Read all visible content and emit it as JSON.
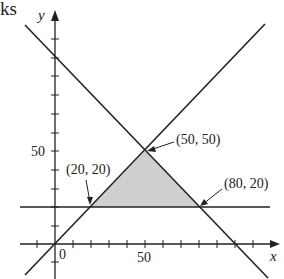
{
  "header_fragment": "ks",
  "diagram": {
    "type": "linear-programming-feasible-region",
    "axes": {
      "x_label": "x",
      "y_label": "y",
      "origin_label": "0",
      "x_tick_label": "50",
      "y_tick_label": "50",
      "tick_interval": 10
    },
    "lines": [
      {
        "name": "y = x",
        "description": "diagonal through origin"
      },
      {
        "name": "x + y = 100",
        "description": "descending diagonal"
      },
      {
        "name": "y = 20",
        "description": "horizontal line"
      }
    ],
    "feasible_region": {
      "shape": "triangle",
      "fill_color": "#cfcfcf",
      "vertices": [
        [
          20,
          20
        ],
        [
          50,
          50
        ],
        [
          80,
          20
        ]
      ]
    },
    "annotations": [
      {
        "text": "(20, 20)",
        "point": [
          20,
          20
        ]
      },
      {
        "text": "(50, 50)",
        "point": [
          50,
          50
        ]
      },
      {
        "text": "(80, 20)",
        "point": [
          80,
          20
        ]
      }
    ],
    "colors": {
      "line": "#222222",
      "region": "#cfcfcf",
      "background": "#ffffff"
    }
  }
}
